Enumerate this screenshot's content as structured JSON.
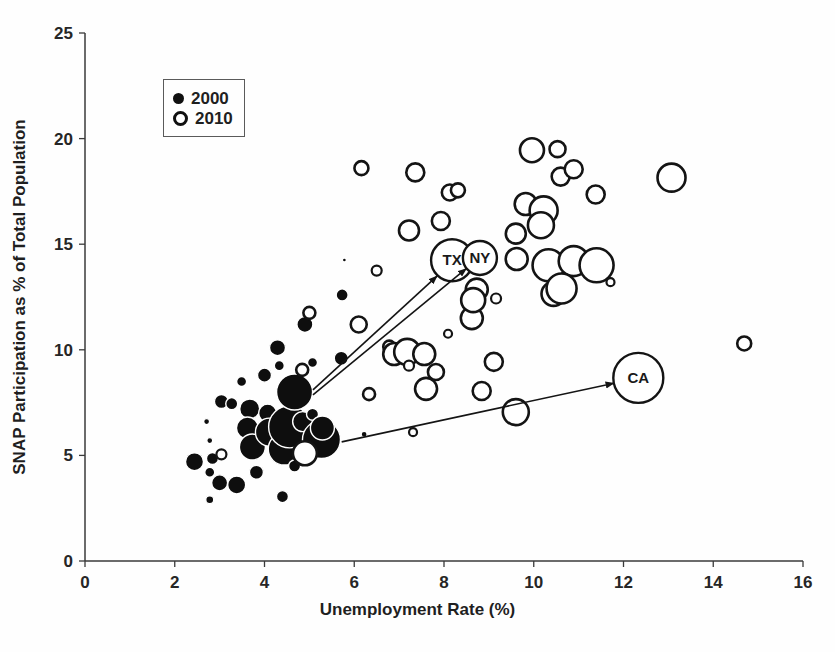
{
  "legend": {
    "items": [
      {
        "label": "2000",
        "marker": "filled-circle"
      },
      {
        "label": "2010",
        "marker": "open-circle"
      }
    ]
  },
  "colors": {
    "point_fill_2000": "#0e0e0e",
    "point_stroke_2010": "#141414",
    "axis": "#3a3a3a",
    "text": "#1f1f1f",
    "background": "#fefefe"
  },
  "chart_data": {
    "type": "scatter",
    "subtype": "bubble",
    "title": "",
    "xlabel": "Unemployment Rate (%)",
    "ylabel": "SNAP Participation as % of Total Population",
    "xlim": [
      0,
      16
    ],
    "ylim": [
      0,
      25
    ],
    "xticks": [
      0,
      2,
      4,
      6,
      8,
      10,
      12,
      14,
      16
    ],
    "yticks": [
      0,
      5,
      10,
      15,
      20,
      25
    ],
    "grid": false,
    "legend_position": "top-left-inside",
    "series": [
      {
        "name": "2000",
        "marker": "filled",
        "points": [
          [
            2.44,
            4.7,
            9
          ],
          [
            2.71,
            6.6,
            3
          ],
          [
            2.78,
            5.7,
            3
          ],
          [
            2.78,
            4.2,
            5
          ],
          [
            2.78,
            2.9,
            4
          ],
          [
            2.84,
            4.85,
            6
          ],
          [
            3.0,
            3.7,
            8
          ],
          [
            3.04,
            7.55,
            7
          ],
          [
            3.27,
            7.45,
            6
          ],
          [
            3.38,
            3.6,
            9
          ],
          [
            3.49,
            8.5,
            5
          ],
          [
            3.67,
            7.2,
            10
          ],
          [
            3.62,
            6.3,
            11
          ],
          [
            3.73,
            5.4,
            13
          ],
          [
            3.82,
            4.2,
            7
          ],
          [
            4.0,
            8.8,
            7
          ],
          [
            4.07,
            7.0,
            9
          ],
          [
            4.29,
            10.1,
            8
          ],
          [
            4.33,
            9.25,
            5
          ],
          [
            4.11,
            6.1,
            14
          ],
          [
            4.44,
            5.3,
            16
          ],
          [
            4.56,
            6.35,
            21
          ],
          [
            4.67,
            8.0,
            18
          ],
          [
            4.67,
            4.5,
            6
          ],
          [
            4.4,
            3.05,
            6
          ],
          [
            4.85,
            6.6,
            10
          ],
          [
            5.07,
            9.4,
            5
          ],
          [
            5.07,
            6.95,
            6
          ],
          [
            5.27,
            5.75,
            19
          ],
          [
            5.29,
            6.3,
            12
          ],
          [
            5.71,
            9.6,
            7
          ],
          [
            5.73,
            12.6,
            6
          ],
          [
            5.78,
            14.25,
            2
          ],
          [
            4.9,
            11.2,
            8
          ],
          [
            6.22,
            6.0,
            3
          ]
        ]
      },
      {
        "name": "2010",
        "marker": "open",
        "points": [
          [
            3.04,
            5.05,
            5
          ],
          [
            4.84,
            9.05,
            6
          ],
          [
            4.9,
            5.1,
            12
          ],
          [
            5.0,
            11.75,
            6
          ],
          [
            6.1,
            11.2,
            8
          ],
          [
            6.33,
            7.9,
            6
          ],
          [
            6.16,
            18.6,
            7
          ],
          [
            6.5,
            13.75,
            5
          ],
          [
            6.78,
            10.15,
            6
          ],
          [
            6.89,
            9.8,
            11
          ],
          [
            7.18,
            9.9,
            13
          ],
          [
            7.22,
            15.65,
            10
          ],
          [
            7.31,
            6.1,
            4
          ],
          [
            7.36,
            18.4,
            9
          ],
          [
            7.22,
            9.25,
            5
          ],
          [
            7.56,
            9.8,
            11
          ],
          [
            7.6,
            8.15,
            11
          ],
          [
            7.82,
            8.95,
            8
          ],
          [
            7.93,
            16.1,
            9
          ],
          [
            8.09,
            10.76,
            4
          ],
          [
            8.13,
            17.45,
            8
          ],
          [
            8.31,
            17.55,
            7
          ],
          [
            8.62,
            11.5,
            11
          ],
          [
            8.73,
            12.85,
            11
          ],
          [
            8.65,
            12.35,
            12
          ],
          [
            9.16,
            12.43,
            5
          ],
          [
            8.84,
            8.05,
            9
          ],
          [
            9.11,
            9.43,
            9
          ],
          [
            9.6,
            7.05,
            13
          ],
          [
            9.6,
            15.5,
            10
          ],
          [
            9.62,
            14.3,
            11
          ],
          [
            9.82,
            16.9,
            11
          ],
          [
            9.96,
            19.45,
            12
          ],
          [
            10.22,
            16.6,
            14
          ],
          [
            10.16,
            15.9,
            13
          ],
          [
            10.33,
            14.0,
            16
          ],
          [
            10.53,
            19.5,
            8
          ],
          [
            10.6,
            18.2,
            9
          ],
          [
            10.89,
            18.55,
            9
          ],
          [
            10.89,
            14.2,
            15
          ],
          [
            10.44,
            12.65,
            12
          ],
          [
            10.62,
            12.9,
            15
          ],
          [
            11.38,
            17.35,
            9
          ],
          [
            11.4,
            14.0,
            17
          ],
          [
            11.71,
            13.2,
            4
          ],
          [
            13.07,
            18.15,
            14
          ],
          [
            14.69,
            10.3,
            7
          ]
        ]
      }
    ],
    "labeled_points": [
      {
        "label": "TX",
        "series": "2010",
        "x": 8.18,
        "y": 14.24,
        "r": 21
      },
      {
        "label": "NY",
        "series": "2010",
        "x": 8.8,
        "y": 14.35,
        "r": 17
      },
      {
        "label": "CA",
        "series": "2010",
        "x": 12.33,
        "y": 8.67,
        "r": 25
      }
    ],
    "arrows": [
      {
        "from": [
          5.08,
          8.1
        ],
        "to": [
          7.85,
          13.5
        ],
        "target": "TX"
      },
      {
        "from": [
          5.08,
          7.87
        ],
        "to": [
          8.5,
          13.85
        ],
        "target": "NY"
      },
      {
        "from": [
          5.72,
          5.64
        ],
        "to": [
          11.79,
          8.42
        ],
        "target": "CA"
      }
    ]
  }
}
